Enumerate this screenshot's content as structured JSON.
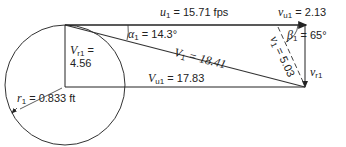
{
  "diagram": {
    "labels": {
      "u1": {
        "sym": "u",
        "sub": "1",
        "value": " = 15.71 fps"
      },
      "vu1": {
        "sym": "v",
        "sub": "u1",
        "value": " = 2.13"
      },
      "alpha1": {
        "sym": "α",
        "sub": "1",
        "value": " = 14.3°"
      },
      "beta1": {
        "sym": "β",
        "sub": "1",
        "value": " = 65°"
      },
      "Vr1": {
        "sym": "V",
        "sub": "r1",
        "eq": " =",
        "value": "4.56"
      },
      "V1": {
        "sym": "V",
        "sub": "1",
        "value": " = 18.41"
      },
      "v1": {
        "sym": "v",
        "sub": "1",
        "value": " = 5.03"
      },
      "vr1": {
        "sym": "v",
        "sub": "r1"
      },
      "r1": {
        "sym": "r",
        "sub": "1",
        "value": " = 0.833 ft"
      },
      "Vu1": {
        "sym": "V",
        "sub": "u1",
        "value": " = 17.83"
      }
    }
  }
}
